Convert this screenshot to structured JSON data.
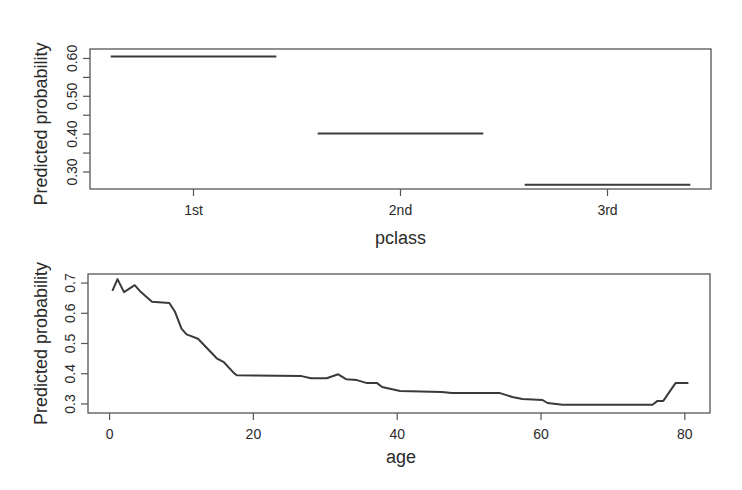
{
  "chart_data": [
    {
      "type": "line",
      "subtype": "step-segments",
      "title": "",
      "xlabel": "pclass",
      "ylabel": "Predicted probability",
      "categories": [
        "1st",
        "2nd",
        "3rd"
      ],
      "values": [
        0.605,
        0.402,
        0.266
      ],
      "y_ticks": [
        "0.30",
        "0.35",
        "0.40",
        "0.45",
        "0.50",
        "0.55",
        "0.60"
      ],
      "y_tick_values": [
        0.3,
        0.35,
        0.4,
        0.45,
        0.5,
        0.55,
        0.6
      ],
      "y_tick_labels_shown": [
        "0.30",
        "0.40",
        "0.50",
        "0.60"
      ],
      "ylim": [
        0.255,
        0.625
      ],
      "grid": false,
      "legend": null
    },
    {
      "type": "line",
      "title": "",
      "xlabel": "age",
      "ylabel": "Predicted probability",
      "x_ticks": [
        "0",
        "20",
        "40",
        "60",
        "80"
      ],
      "x_tick_values": [
        0,
        20,
        40,
        60,
        80
      ],
      "y_ticks": [
        "0.3",
        "0.4",
        "0.5",
        "0.6",
        "0.7"
      ],
      "y_tick_values": [
        0.3,
        0.4,
        0.5,
        0.6,
        0.7
      ],
      "xlim": [
        -3,
        83.5
      ],
      "ylim": [
        0.27,
        0.73
      ],
      "grid": false,
      "legend": null,
      "x": [
        0.4,
        1.1,
        2.0,
        3.5,
        4.2,
        5.9,
        8.3,
        9.1,
        10.0,
        10.7,
        12.3,
        14.9,
        15.9,
        17.3,
        17.7,
        26.7,
        28.0,
        30.2,
        31.8,
        32.9,
        34.4,
        35.8,
        37.2,
        37.9,
        40.4,
        46.2,
        47.6,
        54.3,
        56.0,
        57.4,
        60.2,
        60.9,
        63.0,
        75.5,
        76.2,
        77.0,
        78.7,
        80.5
      ],
      "y": [
        0.674,
        0.713,
        0.67,
        0.693,
        0.674,
        0.638,
        0.634,
        0.605,
        0.549,
        0.53,
        0.516,
        0.451,
        0.438,
        0.402,
        0.395,
        0.392,
        0.385,
        0.385,
        0.398,
        0.382,
        0.379,
        0.369,
        0.369,
        0.356,
        0.343,
        0.339,
        0.336,
        0.336,
        0.323,
        0.316,
        0.313,
        0.303,
        0.297,
        0.297,
        0.31,
        0.31,
        0.369,
        0.369
      ]
    }
  ],
  "layout": {
    "top_panel": {
      "left": 90,
      "top": 49,
      "right": 711,
      "bottom": 189
    },
    "bottom_panel": {
      "left": 88,
      "top": 274,
      "right": 710,
      "bottom": 413
    },
    "line_color": "#3a3a3a",
    "axis_color": "#555555"
  }
}
